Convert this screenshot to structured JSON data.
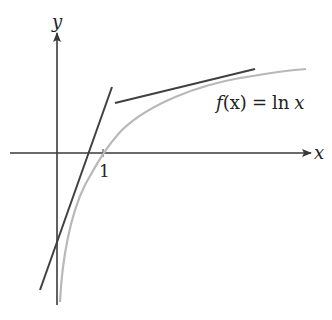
{
  "diagram": {
    "axes": {
      "x_label": "x",
      "y_label": "y",
      "tick_label": "1"
    },
    "function_label": {
      "prefix": "f",
      "arg": "(x)",
      "equals": "=",
      "rhs": "ln",
      "var": "x"
    },
    "colors": {
      "axis": "#3a3a3a",
      "tangent": "#404040",
      "curve": "#b8b8b8",
      "text": "#222222"
    }
  }
}
